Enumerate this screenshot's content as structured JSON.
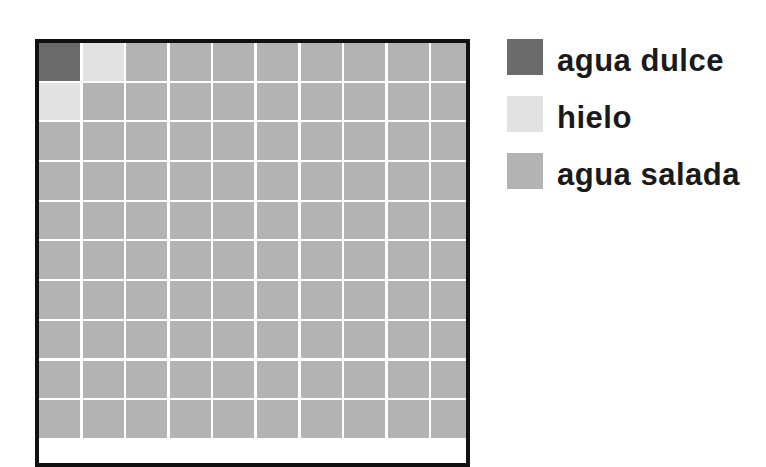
{
  "chart_data": {
    "type": "waffle",
    "title": "",
    "grid": {
      "columns": 10,
      "rows": 10,
      "total_cells": 100,
      "visible_rows": 9
    },
    "categories": [
      "agua dulce",
      "hielo",
      "agua salada"
    ],
    "values": [
      1,
      2,
      97
    ],
    "units": "cells (of 100)",
    "colors": {
      "agua dulce": "#6b6b6b",
      "hielo": "#e2e2e2",
      "agua salada": "#b3b3b3"
    },
    "cell_layout": {
      "agua dulce": [
        [
          0,
          0
        ]
      ],
      "hielo": [
        [
          0,
          1
        ],
        [
          1,
          0
        ]
      ],
      "agua salada": "all remaining cells"
    },
    "legend_position": "right"
  },
  "legend": {
    "items": [
      {
        "label": "agua dulce",
        "color": "#6b6b6b"
      },
      {
        "label": "hielo",
        "color": "#e2e2e2"
      },
      {
        "label": "agua salada",
        "color": "#b3b3b3"
      }
    ]
  },
  "frame": {
    "border_color": "#111111",
    "gap_color": "#ffffff"
  }
}
